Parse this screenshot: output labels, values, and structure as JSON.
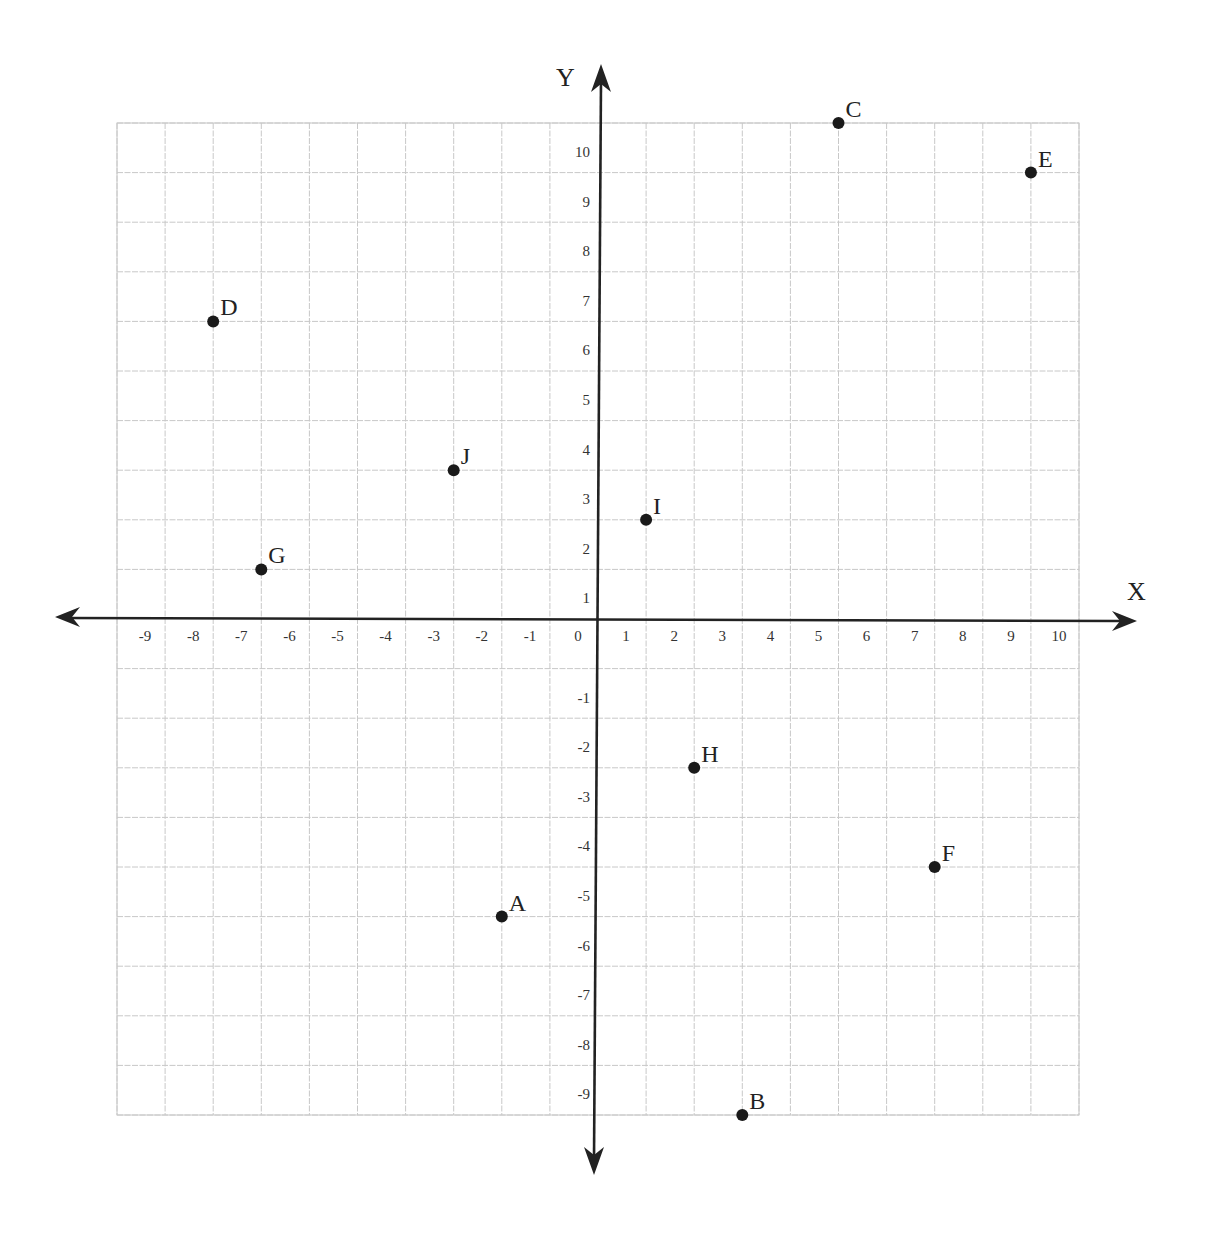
{
  "chart_data": {
    "type": "scatter",
    "title": "",
    "xlabel": "X",
    "ylabel": "Y",
    "xlim": [
      -10,
      10
    ],
    "ylim": [
      -10,
      10
    ],
    "grid": true,
    "legend": null,
    "x_ticks": [
      -9,
      -8,
      -7,
      -6,
      -5,
      -4,
      -3,
      -2,
      -1,
      0,
      1,
      2,
      3,
      4,
      5,
      6,
      7,
      8,
      9,
      10
    ],
    "y_ticks": [
      10,
      9,
      8,
      7,
      6,
      5,
      4,
      3,
      2,
      1,
      -1,
      -2,
      -3,
      -4,
      -5,
      -6,
      -7,
      -8,
      -9
    ],
    "points": [
      {
        "label": "A",
        "x": -2,
        "y": -6
      },
      {
        "label": "B",
        "x": 3,
        "y": -10
      },
      {
        "label": "C",
        "x": 5,
        "y": 10
      },
      {
        "label": "D",
        "x": -8,
        "y": 6
      },
      {
        "label": "E",
        "x": 9,
        "y": 9
      },
      {
        "label": "F",
        "x": 7,
        "y": -5
      },
      {
        "label": "G",
        "x": -7,
        "y": 1
      },
      {
        "label": "H",
        "x": 2,
        "y": -3
      },
      {
        "label": "I",
        "x": 1,
        "y": 2
      },
      {
        "label": "J",
        "x": -3,
        "y": 3
      }
    ]
  },
  "colors": {
    "grid": "#c8c8c8",
    "axis": "#222222",
    "point": "#1a1a1a"
  }
}
